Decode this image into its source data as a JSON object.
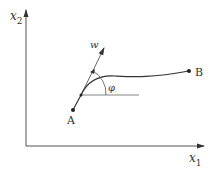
{
  "diagram": {
    "axes": {
      "x_label": "x",
      "x_subscript": "1",
      "y_label": "x",
      "y_subscript": "2"
    },
    "points": {
      "A": "A",
      "B": "B"
    },
    "vector_label": "w",
    "angle_label": "φ",
    "colors": {
      "stroke": "#333333",
      "background": "#ffffff"
    }
  }
}
